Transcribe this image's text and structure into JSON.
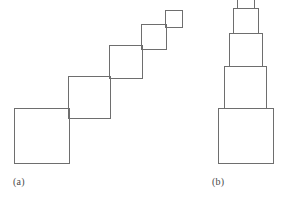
{
  "figure": {
    "background_color": "#ffffff",
    "stroke_color": "#6e6e6e",
    "stroke_width": 1,
    "fill": "none",
    "panels": [
      {
        "id": "panel-a",
        "caption": "(a)",
        "caption_x": 13,
        "caption_y": 176,
        "arrangement": "diagonal-staircase-corner-to-corner",
        "squares": [
          {
            "name": "square-1-largest",
            "size": 55,
            "x": 14,
            "y": 108,
            "order": 1
          },
          {
            "name": "square-2",
            "size": 42,
            "x": 68,
            "y": 76,
            "order": 2
          },
          {
            "name": "square-3",
            "size": 33,
            "x": 109,
            "y": 45,
            "order": 3
          },
          {
            "name": "square-4",
            "size": 25,
            "x": 141,
            "y": 24,
            "order": 4
          },
          {
            "name": "square-5-smallest",
            "size": 17,
            "x": 165,
            "y": 10,
            "order": 5
          }
        ]
      },
      {
        "id": "panel-b",
        "caption": "(b)",
        "caption_x": 212,
        "caption_y": 176,
        "arrangement": "centered-vertical-stack",
        "squares": [
          {
            "name": "square-1-largest",
            "size": 55,
            "x": 218,
            "y": 108,
            "order": 1
          },
          {
            "name": "square-2",
            "size": 42,
            "x": 224,
            "y": 66,
            "order": 2
          },
          {
            "name": "square-3",
            "size": 33,
            "x": 229,
            "y": 33,
            "order": 3
          },
          {
            "name": "square-4",
            "size": 25,
            "x": 233,
            "y": 8,
            "order": 4
          },
          {
            "name": "square-5-smallest",
            "size": 17,
            "x": 237,
            "y": -9,
            "order": 5
          }
        ]
      }
    ]
  },
  "labels": {
    "caption_a": "(a)",
    "caption_b": "(b)"
  },
  "colors": {
    "stroke": "#6e6e6e",
    "caption_text": "#4a4a4a",
    "background": "#ffffff"
  }
}
